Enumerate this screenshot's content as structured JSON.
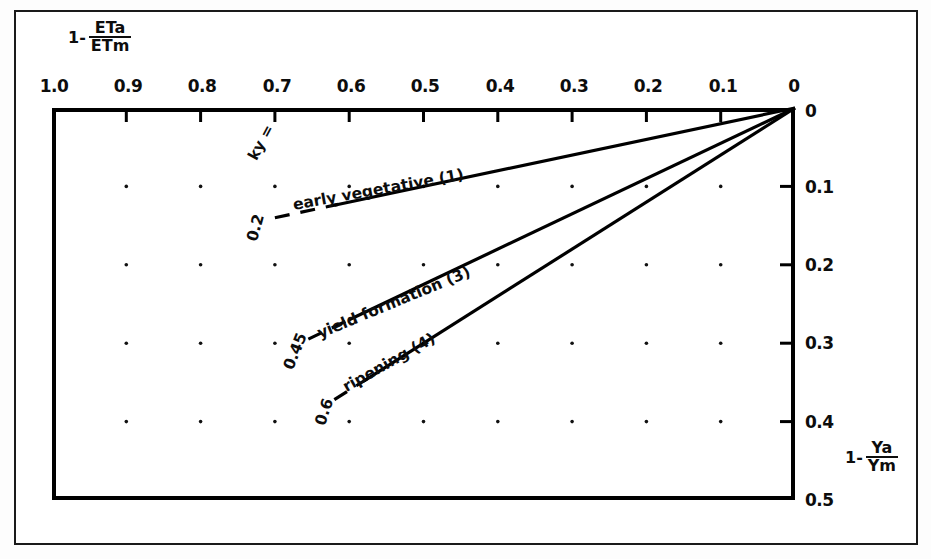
{
  "chart_data": {
    "type": "line",
    "title": "",
    "xlabel": "1 - ETa/ETm",
    "ylabel": "1 - Ya/Ym",
    "xlabel_parts": {
      "lead": "1-",
      "numerator": "ETa",
      "denominator": "ETm"
    },
    "ylabel_parts": {
      "lead": "1-",
      "numerator": "Ya",
      "denominator": "Ym"
    },
    "xlim": [
      1.0,
      0.0
    ],
    "ylim": [
      0.0,
      0.5
    ],
    "x_axis_position": "top",
    "y_axis_position": "right",
    "x_ticks": [
      "1.0",
      "0.9",
      "0.8",
      "0.7",
      "0.6",
      "0.5",
      "0.4",
      "0.3",
      "0.2",
      "0.1",
      "0"
    ],
    "x_tick_values": [
      1.0,
      0.9,
      0.8,
      0.7,
      0.6,
      0.5,
      0.4,
      0.3,
      0.2,
      0.1,
      0.0
    ],
    "y_ticks": [
      "0",
      "0.1",
      "0.2",
      "0.3",
      "0.4",
      "0.5"
    ],
    "y_tick_values": [
      0.0,
      0.1,
      0.2,
      0.3,
      0.4,
      0.5
    ],
    "grid": "dotted-points",
    "legend": "inline-labels",
    "series": [
      {
        "name": "early vegetative (1)",
        "label": "early  vegetative (1)",
        "ky": 0.2,
        "ky_text": "0.2",
        "slope": 0.2,
        "x": [
          1.0,
          0.0
        ],
        "values": [
          0.2,
          0.0
        ]
      },
      {
        "name": "yield formation (3)",
        "label": "yield  formation (3)",
        "ky": 0.45,
        "ky_text": "0.45",
        "slope": 0.45,
        "x": [
          1.0,
          0.0
        ],
        "values": [
          0.45,
          0.0
        ]
      },
      {
        "name": "ripening (4)",
        "label": "ripening (4)",
        "ky": 0.6,
        "ky_text": "0.6",
        "slope": 0.6,
        "x": [
          1.0,
          0.0
        ],
        "values": [
          0.6,
          0.0
        ]
      }
    ],
    "annotations": [
      {
        "text": "ky =",
        "kind": "parameter-name"
      }
    ],
    "colors": {
      "line": "#000000",
      "axis": "#000000",
      "background": "#ffffff"
    }
  },
  "axes": {
    "x_label_lead": "1-",
    "x_label_num": "ETa",
    "x_label_den": "ETm",
    "y_label_lead": "1-",
    "y_label_num": "Ya",
    "y_label_den": "Ym"
  },
  "ticks": {
    "x": [
      "1.0",
      "0.9",
      "0.8",
      "0.7",
      "0.6",
      "0.5",
      "0.4",
      "0.3",
      "0.2",
      "0.1",
      "0"
    ],
    "y": [
      "0",
      "0.1",
      "0.2",
      "0.3",
      "0.4",
      "0.5"
    ]
  },
  "curves": {
    "ky_prefix": "ky =",
    "items": [
      {
        "label": "early  vegetative (1)",
        "ky": "0.2"
      },
      {
        "label": "yield  formation (3)",
        "ky": "0.45"
      },
      {
        "label": "ripening (4)",
        "ky": "0.6"
      }
    ]
  }
}
